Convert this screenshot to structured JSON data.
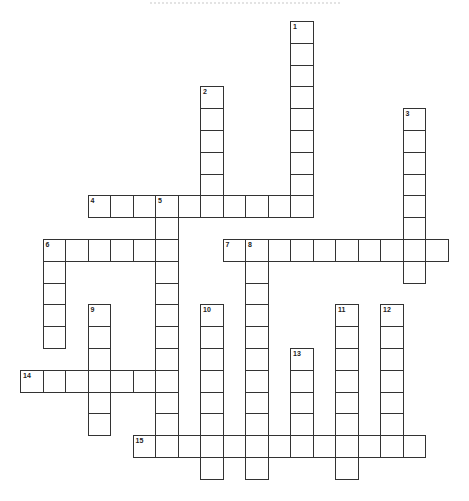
{
  "puzzle": {
    "title": "",
    "grid": {
      "origin_x": 20,
      "origin_y": 21,
      "cell_w": 22.5,
      "cell_h": 21.8
    },
    "entries": [
      {
        "number": "1",
        "direction": "down",
        "row": 0,
        "col": 12,
        "length": 9
      },
      {
        "number": "2",
        "direction": "down",
        "row": 3,
        "col": 8,
        "length": 6
      },
      {
        "number": "3",
        "direction": "down",
        "row": 4,
        "col": 17,
        "length": 8
      },
      {
        "number": "4",
        "direction": "across",
        "row": 8,
        "col": 3,
        "length": 10
      },
      {
        "number": "5",
        "direction": "down",
        "row": 8,
        "col": 6,
        "length": 12
      },
      {
        "number": "6",
        "direction": "across",
        "row": 10,
        "col": 1,
        "length": 6
      },
      {
        "number": "6",
        "direction": "down",
        "row": 10,
        "col": 1,
        "length": 5
      },
      {
        "number": "7",
        "direction": "across",
        "row": 10,
        "col": 9,
        "length": 10
      },
      {
        "number": "8",
        "direction": "down",
        "row": 10,
        "col": 10,
        "length": 11
      },
      {
        "number": "9",
        "direction": "down",
        "row": 13,
        "col": 3,
        "length": 6
      },
      {
        "number": "10",
        "direction": "down",
        "row": 13,
        "col": 8,
        "length": 8
      },
      {
        "number": "11",
        "direction": "down",
        "row": 13,
        "col": 14,
        "length": 8
      },
      {
        "number": "12",
        "direction": "down",
        "row": 13,
        "col": 16,
        "length": 7
      },
      {
        "number": "13",
        "direction": "down",
        "row": 15,
        "col": 12,
        "length": 5
      },
      {
        "number": "14",
        "direction": "across",
        "row": 16,
        "col": 0,
        "length": 7
      },
      {
        "number": "15",
        "direction": "across",
        "row": 19,
        "col": 5,
        "length": 13
      }
    ]
  }
}
